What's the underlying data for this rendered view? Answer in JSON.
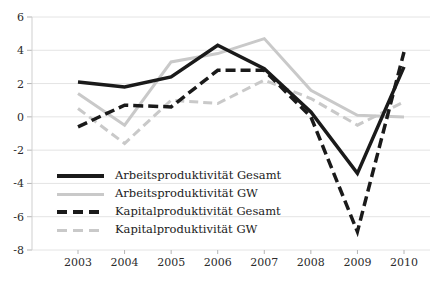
{
  "chart_data": {
    "type": "line",
    "title": "",
    "xlabel": "",
    "ylabel": "",
    "x": [
      2003,
      2004,
      2005,
      2006,
      2007,
      2008,
      2009,
      2010
    ],
    "series": [
      {
        "name": "Arbeitsproduktivität Gesamt",
        "values": [
          2.1,
          1.8,
          2.4,
          4.3,
          2.9,
          0.3,
          -3.4,
          3.0
        ],
        "color": "#1a1a1a",
        "dash": "none",
        "width": 3.5
      },
      {
        "name": "Arbeitsproduktivität GW",
        "values": [
          1.4,
          -0.5,
          3.3,
          3.8,
          4.7,
          1.6,
          0.1,
          0.0
        ],
        "color": "#c9c9c9",
        "dash": "none",
        "width": 3
      },
      {
        "name": "Kapitalproduktivität Gesamt",
        "values": [
          -0.6,
          0.7,
          0.6,
          2.8,
          2.8,
          0.0,
          -6.9,
          3.9
        ],
        "color": "#1a1a1a",
        "dash": "10 5",
        "width": 3.5
      },
      {
        "name": "Kapitalproduktivität GW",
        "values": [
          0.5,
          -1.6,
          1.0,
          0.8,
          2.2,
          1.1,
          -0.5,
          0.9
        ],
        "color": "#c9c9c9",
        "dash": "9 5",
        "width": 3
      }
    ],
    "ylim": [
      -8,
      6
    ],
    "y_ticks": [
      "6",
      "4",
      "2",
      "0",
      "-2",
      "-4",
      "-6",
      "-8"
    ],
    "x_ticks": [
      "2003",
      "2004",
      "2005",
      "2006",
      "2007",
      "2008",
      "2009",
      "2010"
    ],
    "grid": true,
    "legend_position": "inside-bottom-left",
    "colors": {
      "background": "#ffffff",
      "gridline": "#e4e4e4",
      "axis": "#cfcfcf",
      "tick_mark": "#b5b5b5",
      "tick_text": "#2b2b2b",
      "series_dark": "#1a1a1a",
      "series_light": "#c9c9c9"
    },
    "draw_order": [
      3,
      1,
      0,
      2
    ]
  }
}
